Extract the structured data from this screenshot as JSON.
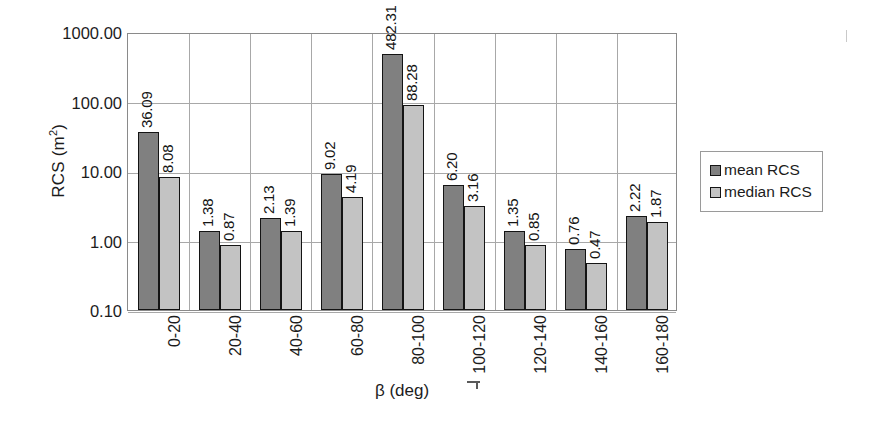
{
  "chart_data": {
    "type": "bar",
    "title": "",
    "xlabel": "β (deg)",
    "ylabel": "RCS (m²)",
    "ylabel_base": "RCS (m",
    "ylabel_sup": "2",
    "ylabel_close": ")",
    "yscale": "log",
    "ylim": [
      0.1,
      1000
    ],
    "ytick_labels": [
      "1000.00",
      "100.00",
      "10.00",
      "1.00",
      "0.10"
    ],
    "ytick_values": [
      1000,
      100,
      10,
      1,
      0.1
    ],
    "grid": true,
    "legend_position": "right",
    "categories": [
      "0-20",
      "20-40",
      "40-60",
      "60-80",
      "80-100",
      "100-120",
      "120-140",
      "140-160",
      "160-180"
    ],
    "series": [
      {
        "name": "mean RCS",
        "color": "#808080",
        "values": [
          36.09,
          1.38,
          2.13,
          9.02,
          482.31,
          6.2,
          1.35,
          0.76,
          2.22
        ],
        "labels": [
          "36.09",
          "1.38",
          "2.13",
          "9.02",
          "482.31",
          "6.20",
          "1.35",
          "0.76",
          "2.22"
        ]
      },
      {
        "name": "median RCS",
        "color": "#c3c3c3",
        "values": [
          8.08,
          0.87,
          1.39,
          4.19,
          88.28,
          3.16,
          0.85,
          0.47,
          1.87
        ],
        "labels": [
          "8.08",
          "0.87",
          "1.39",
          "4.19",
          "88.28",
          "3.16",
          "0.85",
          "0.47",
          "1.87"
        ]
      }
    ]
  },
  "legend": {
    "items": [
      {
        "label": "mean RCS",
        "swatch": "mean"
      },
      {
        "label": "median RCS",
        "swatch": "median"
      }
    ]
  }
}
